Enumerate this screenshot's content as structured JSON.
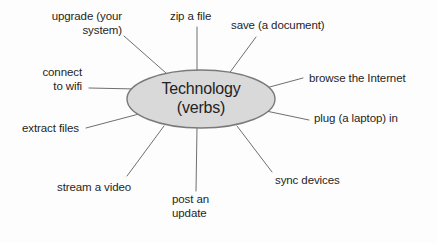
{
  "diagram": {
    "type": "word-web",
    "background_color": "#fdfdfd",
    "center": {
      "label": "Technology\n(verbs)",
      "line1": "Technology",
      "line2": "(verbs)",
      "shape": "ellipse",
      "fill_color": "#d9d9d9",
      "stroke_color": "#7a7a7a",
      "cx": 201,
      "cy": 99,
      "rx": 74,
      "ry": 29
    },
    "connector_color": "#6f6f6f",
    "text_color": "#1f1f1f",
    "nodes": [
      {
        "id": "upgrade",
        "label": "upgrade (your\nsystem)",
        "align": "right",
        "x": 22,
        "y": 10,
        "width": 100,
        "line_from": {
          "x": 124,
          "y": 36
        },
        "line_to": {
          "x": 166,
          "y": 73
        }
      },
      {
        "id": "zip",
        "label": "zip a file",
        "align": "left",
        "x": 170,
        "y": 10,
        "width": 60,
        "line_from": {
          "x": 197,
          "y": 27
        },
        "line_to": {
          "x": 197,
          "y": 71
        }
      },
      {
        "id": "save",
        "label": "save (a document)",
        "align": "left",
        "x": 231,
        "y": 19,
        "width": 120,
        "line_from": {
          "x": 256,
          "y": 37
        },
        "line_to": {
          "x": 228,
          "y": 75
        }
      },
      {
        "id": "browse",
        "label": "browse the Internet",
        "align": "left",
        "x": 309,
        "y": 72,
        "width": 125,
        "line_from": {
          "x": 303,
          "y": 78
        },
        "line_to": {
          "x": 266,
          "y": 88
        }
      },
      {
        "id": "plug",
        "label": "plug (a laptop) in",
        "align": "left",
        "x": 314,
        "y": 112,
        "width": 120,
        "line_from": {
          "x": 309,
          "y": 120
        },
        "line_to": {
          "x": 266,
          "y": 111
        }
      },
      {
        "id": "sync",
        "label": "sync devices",
        "align": "left",
        "x": 275,
        "y": 174,
        "width": 85,
        "line_from": {
          "x": 272,
          "y": 172
        },
        "line_to": {
          "x": 237,
          "y": 126
        }
      },
      {
        "id": "post",
        "label": "post an\nupdate",
        "align": "left",
        "x": 172,
        "y": 193,
        "width": 60,
        "line_from": {
          "x": 196,
          "y": 191
        },
        "line_to": {
          "x": 197,
          "y": 128
        }
      },
      {
        "id": "stream",
        "label": "stream a video",
        "align": "left",
        "x": 57,
        "y": 181,
        "width": 100,
        "line_from": {
          "x": 127,
          "y": 176
        },
        "line_to": {
          "x": 164,
          "y": 126
        }
      },
      {
        "id": "extract",
        "label": "extract files",
        "align": "left",
        "x": 22,
        "y": 122,
        "width": 80,
        "line_from": {
          "x": 86,
          "y": 128
        },
        "line_to": {
          "x": 139,
          "y": 114
        }
      },
      {
        "id": "connect",
        "label": "connect\nto wifi",
        "align": "right",
        "x": 22,
        "y": 66,
        "width": 60,
        "line_from": {
          "x": 89,
          "y": 88
        },
        "line_to": {
          "x": 136,
          "y": 89
        }
      }
    ]
  }
}
